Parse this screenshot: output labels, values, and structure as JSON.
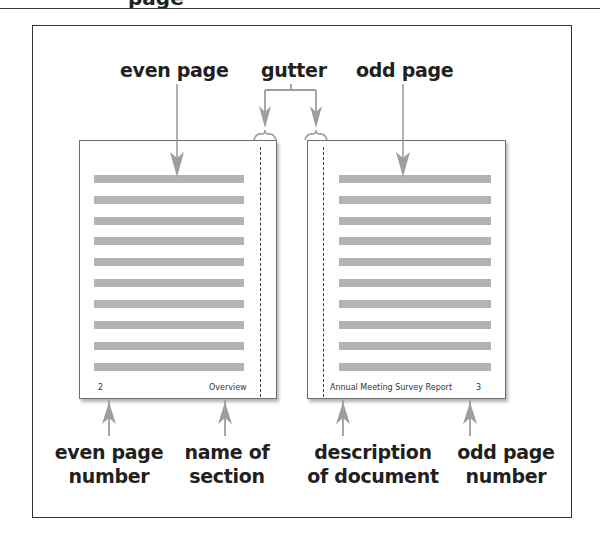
{
  "heading": {
    "text": "page"
  },
  "labels": {
    "even_page": "even page",
    "gutter": "gutter",
    "odd_page": "odd page",
    "even_page_number_line1": "even page",
    "even_page_number_line2": "number",
    "name_of_section_line1": "name of",
    "name_of_section_line2": "section",
    "description_line1": "description",
    "description_line2": "of document",
    "odd_page_number_line1": "odd page",
    "odd_page_number_line2": "number"
  },
  "left_page": {
    "footer_page_number": "2",
    "footer_section_name": "Overview",
    "text_line_count": 10
  },
  "right_page": {
    "footer_description": "Annual Meeting Survey Report",
    "footer_page_number": "3",
    "text_line_count": 10
  },
  "colors": {
    "arrow": "#9e9e9e",
    "text_line": "#b3b3b3",
    "frame": "#333333",
    "label_text": "#231f20"
  }
}
